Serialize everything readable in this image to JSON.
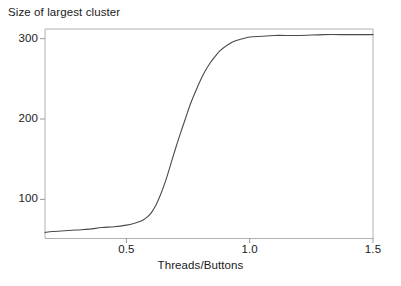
{
  "chart_data": {
    "type": "line",
    "title": "Size of largest cluster",
    "subtitle": "",
    "xlabel": "Threads/Buttons",
    "ylabel": "",
    "xlim": [
      0.17,
      1.5
    ],
    "ylim": [
      52,
      312
    ],
    "grid": false,
    "legend": null,
    "xticks": [
      0.5,
      1.0,
      1.5
    ],
    "xtick_labels": [
      "0.5",
      "1.0",
      "1.5"
    ],
    "yticks": [
      100,
      200,
      300
    ],
    "ytick_labels": [
      "100",
      "200",
      "300"
    ],
    "series": [
      {
        "name": "largest cluster size",
        "color": "#4a4a4a",
        "linewidth": 1.1,
        "x": [
          0.17,
          0.2,
          0.25,
          0.3,
          0.35,
          0.4,
          0.45,
          0.5,
          0.53,
          0.56,
          0.58,
          0.6,
          0.62,
          0.64,
          0.66,
          0.68,
          0.7,
          0.72,
          0.74,
          0.76,
          0.78,
          0.8,
          0.82,
          0.84,
          0.86,
          0.88,
          0.9,
          0.92,
          0.94,
          0.96,
          1.0,
          1.05,
          1.1,
          1.2,
          1.3,
          1.4,
          1.5
        ],
        "y": [
          59,
          60,
          61,
          62,
          63,
          65,
          66,
          68,
          70,
          73,
          77,
          83,
          93,
          107,
          124,
          144,
          164,
          183,
          201,
          219,
          234,
          248,
          260,
          270,
          278,
          285,
          290,
          294,
          297,
          299,
          302,
          303,
          304,
          304,
          305,
          305,
          305
        ]
      }
    ],
    "annotations": []
  },
  "figure": {
    "background_color": "#ffffff",
    "axis_color": "#aaaaaa",
    "text_color": "#1a1a1a",
    "curve_color": "#4a4a4a"
  }
}
